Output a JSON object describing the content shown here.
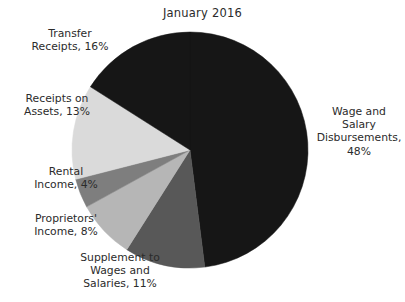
{
  "chart_data": {
    "type": "pie",
    "title": "January 2016",
    "subtitle": "",
    "xlabel": "",
    "ylabel": "",
    "legend_position": "none",
    "grid": false,
    "units": "percent",
    "total": 100,
    "categories": [
      "Wage and Salary Disbursements",
      "Supplement to Wages and Salaries",
      "Proprietors' Income",
      "Rental Income",
      "Receipts on Assets",
      "Transfer Receipts"
    ],
    "values": [
      48,
      11,
      8,
      4,
      13,
      16
    ],
    "slices": [
      {
        "name": "Wage and Salary Disbursements",
        "value": 48,
        "label": "Wage and\nSalary\nDisbursements,\n48%",
        "color": "#161616",
        "start_angle": 0,
        "end_angle": 172.8
      },
      {
        "name": "Supplement to Wages and Salaries",
        "value": 11,
        "label": "Supplement to\nWages and\nSalaries, 11%",
        "color": "#585858",
        "start_angle": 172.8,
        "end_angle": 212.4
      },
      {
        "name": "Proprietors' Income",
        "value": 8,
        "label": "Proprietors'\nIncome, 8%",
        "color": "#b6b6b6",
        "start_angle": 212.4,
        "end_angle": 241.2
      },
      {
        "name": "Rental Income",
        "value": 4,
        "label": "Rental\nIncome, 4%",
        "color": "#7e7e7e",
        "start_angle": 241.2,
        "end_angle": 255.6
      },
      {
        "name": "Receipts on Assets",
        "value": 13,
        "label": "Receipts on\nAssets, 13%",
        "color": "#dadada",
        "start_angle": 255.6,
        "end_angle": 302.4
      },
      {
        "name": "Transfer Receipts",
        "value": 16,
        "label": "Transfer\nReceipts, 16%",
        "color": "#161616",
        "start_angle": 302.4,
        "end_angle": 360
      }
    ],
    "geometry": {
      "center_x": 190,
      "center_y": 150,
      "radius": 118
    }
  },
  "labels": {
    "wage": "Wage and\nSalary\nDisbursements,\n48%",
    "supplement": "Supplement to\nWages and\nSalaries, 11%",
    "proprietors": "Proprietors'\nIncome, 8%",
    "rental": "Rental\nIncome, 4%",
    "receipts_assets": "Receipts on\nAssets, 13%",
    "transfer": "Transfer\nReceipts, 16%"
  },
  "title": "January 2016"
}
